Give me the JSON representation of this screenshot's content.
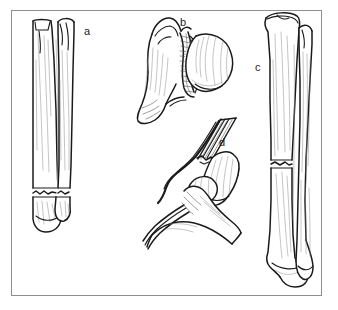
{
  "figure": {
    "background_color": "#ffffff",
    "frame_color": "#8e8e8e",
    "ink_color": "#1a1a1a",
    "shading_color": "#9a9a9a",
    "panel_count": 4
  },
  "labels": {
    "a": "a",
    "b": "b",
    "c": "c",
    "d": "d"
  },
  "panels": [
    {
      "key": "a",
      "label": "a",
      "label_x": 87,
      "label_y": 31,
      "subject": "tibia-and-fibula-anterior-view",
      "fracture": "transverse-distal-shaft-both-bones",
      "view": "anterior"
    },
    {
      "key": "b",
      "label": "b",
      "label_x": 183,
      "label_y": 22,
      "subject": "proximal-femur-with-femoral-head",
      "fracture": "comminuted-femoral-neck",
      "view": "anterior"
    },
    {
      "key": "c",
      "label": "c",
      "label_x": 258,
      "label_y": 67,
      "subject": "tibia-and-fibula-posterior-view",
      "fracture": "transverse-mid-shaft-tibia",
      "view": "posterior"
    },
    {
      "key": "d",
      "label": "d",
      "label_x": 222,
      "label_y": 142,
      "subject": "elbow-distal-humerus-radius-ulna",
      "fracture": "supracondylar-humerus",
      "view": "lateral"
    }
  ]
}
